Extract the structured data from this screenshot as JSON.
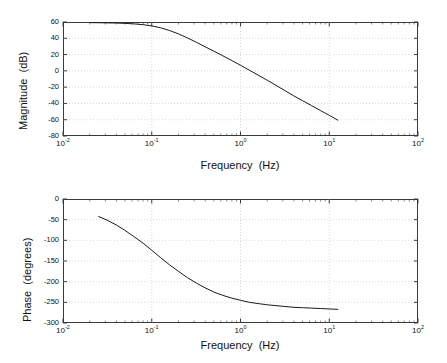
{
  "figure": {
    "kind": "bode-plot",
    "background_color": "#ffffff",
    "axis_color": "#3a3a3a",
    "grid_color": "#c8c8c8",
    "curve_color": "#1a1a1a"
  },
  "magnitude_panel": {
    "y_axis_title": "Magnitude  (dB)",
    "x_axis_title": "Frequency  (Hz)",
    "y_tick_labels": [
      "60",
      "40",
      "20",
      "0",
      "-20",
      "-40",
      "-60",
      "-80"
    ],
    "x_tick_labels": [
      "10-2",
      "10-1",
      "100",
      "101",
      "102"
    ],
    "x_tick_mantissa": [
      "10",
      "10",
      "10",
      "10",
      "10"
    ],
    "x_tick_exponents": [
      "-2",
      "-1",
      "0",
      "1",
      "2"
    ]
  },
  "phase_panel": {
    "y_axis_title": "Phase  (degrees)",
    "x_axis_title": "Frequency  (Hz)",
    "y_tick_labels": [
      "0",
      "-50",
      "-100",
      "-150",
      "-200",
      "-250",
      "-300"
    ],
    "x_tick_labels": [
      "10-2",
      "10-1",
      "100",
      "101",
      "102"
    ],
    "x_tick_mantissa": [
      "10",
      "10",
      "10",
      "10",
      "10"
    ],
    "x_tick_exponents": [
      "-2",
      "-1",
      "0",
      "1",
      "2"
    ]
  },
  "chart_data": [
    {
      "type": "line",
      "title": "",
      "xlabel": "Frequency  (Hz)",
      "ylabel": "Magnitude  (dB)",
      "xscale": "log",
      "xlim": [
        0.01,
        100
      ],
      "ylim": [
        -80,
        60
      ],
      "ytick_step": 20,
      "yticks": [
        60,
        40,
        20,
        0,
        -20,
        -40,
        -60,
        -80
      ],
      "xticks": [
        0.01,
        0.1,
        1,
        10,
        100
      ],
      "grid": true,
      "legend": "none",
      "series": [
        {
          "name": "magnitude",
          "x": [
            0.02,
            0.025,
            0.032,
            0.04,
            0.05,
            0.063,
            0.08,
            0.1,
            0.126,
            0.158,
            0.2,
            0.251,
            0.316,
            0.4,
            0.5,
            0.63,
            0.8,
            1.0,
            1.26,
            1.58,
            2.0,
            2.51,
            3.16,
            4.0,
            5.0,
            6.3,
            8.0,
            10.0,
            12.6
          ],
          "y": [
            59.2,
            59.1,
            58.9,
            58.7,
            58.3,
            57.7,
            56.7,
            55.2,
            52.9,
            49.6,
            45.4,
            40.6,
            35.3,
            29.5,
            24.2,
            18.6,
            12.6,
            6.9,
            0.8,
            -5.3,
            -11.5,
            -17.8,
            -24.2,
            -30.8,
            -36.6,
            -42.6,
            -48.9,
            -54.6,
            -60.8
          ]
        }
      ]
    },
    {
      "type": "line",
      "title": "",
      "xlabel": "Frequency  (Hz)",
      "ylabel": "Phase  (degrees)",
      "xscale": "log",
      "xlim": [
        0.01,
        100
      ],
      "ylim": [
        -300,
        0
      ],
      "ytick_step": 50,
      "yticks": [
        0,
        -50,
        -100,
        -150,
        -200,
        -250,
        -300
      ],
      "xticks": [
        0.01,
        0.1,
        1,
        10,
        100
      ],
      "grid": true,
      "legend": "none",
      "series": [
        {
          "name": "phase",
          "x": [
            0.025,
            0.032,
            0.04,
            0.05,
            0.063,
            0.08,
            0.1,
            0.126,
            0.158,
            0.2,
            0.251,
            0.316,
            0.4,
            0.5,
            0.63,
            0.8,
            1.0,
            1.26,
            1.58,
            2.0,
            2.51,
            3.16,
            4.0,
            5.0,
            6.3,
            8.0,
            10.0,
            12.6
          ],
          "y": [
            -42,
            -52,
            -63,
            -76,
            -91,
            -107,
            -124,
            -142,
            -159,
            -175,
            -190,
            -203,
            -215,
            -225,
            -233,
            -240,
            -245,
            -250,
            -253,
            -256,
            -258,
            -260,
            -262,
            -263,
            -264,
            -265,
            -266,
            -267
          ]
        }
      ]
    }
  ]
}
